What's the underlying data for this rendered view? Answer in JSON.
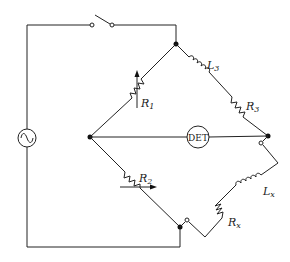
{
  "diagram": {
    "type": "AC bridge circuit (Maxwell/Hay-type inductance bridge)",
    "components": {
      "source": {
        "name": "AC source",
        "symbol": "sine-wave"
      },
      "switch": {
        "name": "switch",
        "state": "open"
      },
      "detector": {
        "label": "DET"
      },
      "r1": {
        "label": "R",
        "sub": "1",
        "variable": true
      },
      "r2": {
        "label": "R",
        "sub": "2",
        "variable": true
      },
      "l3": {
        "label": "L",
        "sub": "3"
      },
      "r3": {
        "label": "R",
        "sub": "3"
      },
      "lx": {
        "label": "L",
        "sub": "x"
      },
      "rx": {
        "label": "R",
        "sub": "x"
      }
    },
    "colors": {
      "line": "#222222",
      "background": "#ffffff"
    }
  }
}
